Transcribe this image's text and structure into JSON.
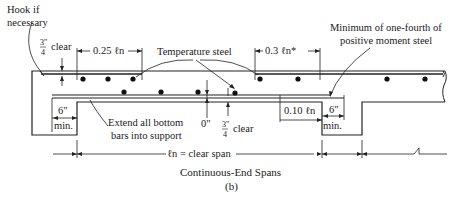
{
  "diagram": {
    "title": "Continuous-End Spans",
    "subtitle": "(b)",
    "colors": {
      "ink": "#222222",
      "background": "#ffffff"
    },
    "labels": {
      "hook": [
        "Hook if",
        "necessary"
      ],
      "top_clear_frac_num": "3\"",
      "top_clear_frac_den": "4",
      "top_clear_word": "clear",
      "left_extent": "0.25 ℓn",
      "temperature_steel": "Temperature steel",
      "right_extent": "0.3 ℓn*",
      "min_pos_steel": [
        "Minimum of one-fourth of",
        "positive moment steel"
      ],
      "left_6": "6\"",
      "left_min": "min.",
      "extend_bottom": [
        "Extend all bottom",
        "bars into support"
      ],
      "zero_in": "0\"",
      "bot_clear_frac_num": "3\"",
      "bot_clear_frac_den": "4",
      "bot_clear_word": "clear",
      "right_extent_bottom": "0.10 ℓn",
      "right_6": "6\"",
      "right_min": "min.",
      "clear_span": "ℓn = clear span"
    },
    "rebar": {
      "top_left_dots_x": [
        83,
        108,
        133
      ],
      "top_right_dots_x": [
        260,
        298,
        387,
        425
      ],
      "bottom_dots_x": [
        124,
        161,
        198,
        235
      ]
    }
  }
}
